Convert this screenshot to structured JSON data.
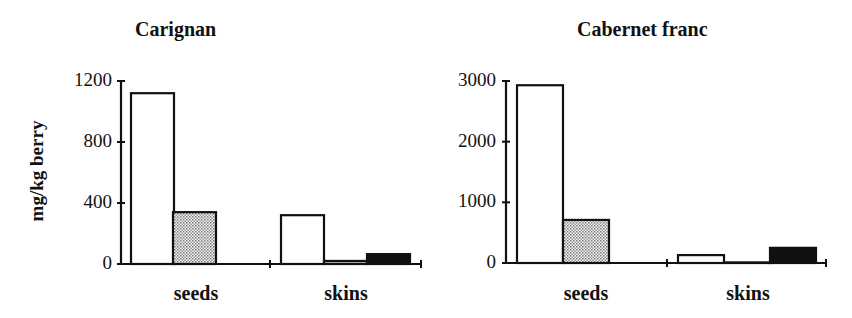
{
  "figure": {
    "ylabel": "mg/kg berry"
  },
  "chart_data": [
    {
      "type": "bar",
      "title": "Carignan",
      "xlabel": "",
      "ylabel": "mg/kg berry",
      "ylim": [
        0,
        1200
      ],
      "yticks": [
        "0",
        "400",
        "800",
        "1200"
      ],
      "categories": [
        "seeds",
        "skins"
      ],
      "series": [
        {
          "name": "series 1 (white)",
          "fill": "#ffffff",
          "values": [
            1120,
            320
          ]
        },
        {
          "name": "series 2 (dotted)",
          "fill": "#c8c8c8",
          "values": [
            340,
            20
          ]
        },
        {
          "name": "series 3 (black)",
          "fill": "#111111",
          "values": [
            0,
            65
          ]
        }
      ],
      "grid": false,
      "legend": "none"
    },
    {
      "type": "bar",
      "title": "Cabernet franc",
      "xlabel": "",
      "ylabel": "",
      "ylim": [
        0,
        3000
      ],
      "yticks": [
        "0",
        "1000",
        "2000",
        "3000"
      ],
      "categories": [
        "seeds",
        "skins"
      ],
      "series": [
        {
          "name": "series 1 (white)",
          "fill": "#ffffff",
          "values": [
            2930,
            130
          ]
        },
        {
          "name": "series 2 (dotted)",
          "fill": "#c8c8c8",
          "values": [
            710,
            10
          ]
        },
        {
          "name": "series 3 (black)",
          "fill": "#111111",
          "values": [
            0,
            250
          ]
        }
      ],
      "grid": false,
      "legend": "none"
    }
  ]
}
